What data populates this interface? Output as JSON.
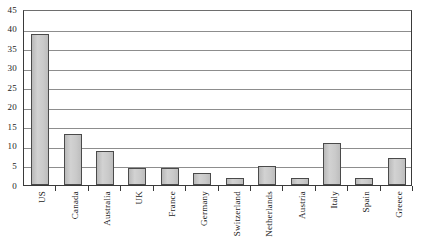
{
  "chart_data": {
    "type": "bar",
    "title": "",
    "subtitle": "",
    "xlabel": "",
    "ylabel": "",
    "categories": [
      "US",
      "Canada",
      "Australia",
      "UK",
      "France",
      "Germany",
      "Switzerland",
      "Netherlands",
      "Austria",
      "Italy",
      "Spain",
      "Greece"
    ],
    "values": [
      38.5,
      13.0,
      8.6,
      4.4,
      4.4,
      3.2,
      1.8,
      4.9,
      1.7,
      10.8,
      1.8,
      6.8
    ],
    "ylim": [
      0,
      45
    ],
    "ytick_step": 5,
    "yticks": [
      0,
      5,
      10,
      15,
      20,
      25,
      30,
      35,
      40,
      45
    ],
    "ytick_labels": [
      "0",
      "5",
      "10",
      "15",
      "20",
      "25",
      "30",
      "35",
      "40",
      "45"
    ],
    "grid": true,
    "grid_axis": "y",
    "legend": false,
    "legend_position": "none",
    "annotations": [],
    "bar_fill_color": "#c9c9c9",
    "bar_edge_color": "#4a4a4a",
    "gridline_color": "#8d8d8d",
    "axis_color": "#3a3a3a",
    "text_color": "#1a1a1a",
    "background_color": "#ffffff"
  }
}
